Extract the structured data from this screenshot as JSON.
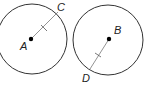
{
  "diagram": {
    "circles": [
      {
        "center_label": "A",
        "point_label": "C"
      },
      {
        "center_label": "B",
        "point_label": "D"
      }
    ],
    "colors": {
      "stroke": "#333333",
      "radius": "#666666"
    }
  }
}
